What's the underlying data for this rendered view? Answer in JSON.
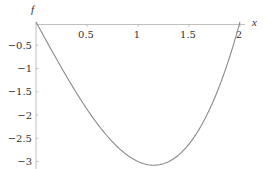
{
  "chart_data": {
    "type": "line",
    "title": "",
    "xlabel": "x",
    "ylabel": "f",
    "xlim": [
      0,
      2.05
    ],
    "ylim": [
      -3.15,
      0.1
    ],
    "grid": false,
    "legend": null,
    "x_ticks": [
      0.5,
      1,
      1.5,
      2
    ],
    "x_tick_labels": [
      "0.5",
      "1",
      "1.5",
      "2"
    ],
    "y_ticks": [
      -0.5,
      -1,
      -1.5,
      -2,
      -2.5,
      -3
    ],
    "y_tick_labels": [
      "-0.5",
      "-1",
      "-1.5",
      "-2",
      "-2.5",
      "-3"
    ],
    "series": [
      {
        "name": "f(x)",
        "expression": "x^3 - 4x",
        "color": "#8a8a8a",
        "x": [
          0,
          0.1,
          0.2,
          0.3,
          0.4,
          0.5,
          0.6,
          0.7,
          0.8,
          0.9,
          1.0,
          1.1,
          1.155,
          1.2,
          1.3,
          1.4,
          1.5,
          1.6,
          1.7,
          1.8,
          1.9,
          2.0
        ],
        "y": [
          0,
          -0.399,
          -0.792,
          -1.173,
          -1.536,
          -1.875,
          -2.184,
          -2.457,
          -2.688,
          -2.871,
          -3.0,
          -3.069,
          -3.079,
          -3.072,
          -3.003,
          -2.856,
          -2.625,
          -2.304,
          -1.887,
          -1.368,
          -0.741,
          0
        ]
      }
    ],
    "minimum": {
      "x": 1.155,
      "y": -3.079
    }
  },
  "colors": {
    "axis": "#b0b0b0",
    "curve": "#8a8a8a",
    "text": "#333333"
  },
  "layout": {
    "origin_px": [
      36,
      22
    ],
    "x_px_per_unit": 102,
    "y_px_per_unit": 46.5
  }
}
